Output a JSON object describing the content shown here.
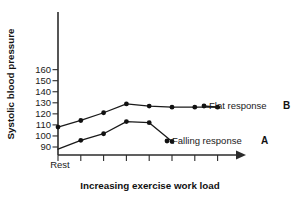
{
  "chart_data": {
    "type": "line",
    "title": "",
    "xlabel": "Increasing exercise work load",
    "ylabel": "Systolic blood pressure",
    "grid": false,
    "legend_position": "inline-right",
    "ylim": [
      85,
      168
    ],
    "yticks": [
      90,
      100,
      110,
      120,
      130,
      140,
      150,
      160
    ],
    "ytick_labels": [
      "90",
      "100",
      "110",
      "120",
      "130",
      "140",
      "150",
      "160"
    ],
    "x_origin_label": "Rest",
    "x_tick_count": 8,
    "x_axis_arrow": true,
    "x": [
      0,
      1,
      2,
      3,
      4,
      5,
      6,
      7
    ],
    "series": [
      {
        "name": "Flat response",
        "key": "B",
        "values": [
          108,
          114,
          121,
          129,
          127,
          126,
          126,
          126
        ],
        "annotation": "Flat response",
        "annotation_key": "B"
      },
      {
        "name": "Falling response",
        "key": "A",
        "values": [
          96,
          102,
          113,
          112,
          95
        ],
        "x": [
          1,
          2,
          3,
          4,
          5
        ],
        "origin_start": 88,
        "annotation": "Falling response",
        "annotation_key": "A"
      }
    ],
    "colors": {
      "axis": "#2b2b2b",
      "line": "#1a1a1a",
      "point": "#111111",
      "text": "#1a1a1a",
      "background": "#ffffff"
    }
  }
}
